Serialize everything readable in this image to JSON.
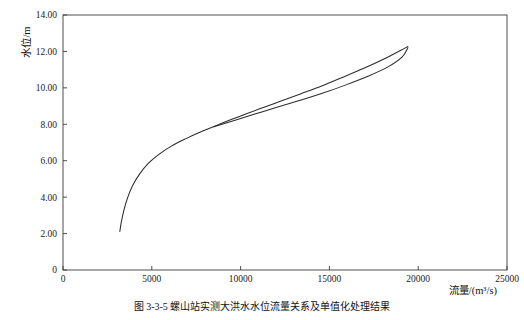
{
  "figure": {
    "caption": "图 3-3-5  螺山站实测大洪水水位流量关系及单值化处理结果"
  },
  "chart_data": {
    "type": "line",
    "title": "",
    "xlabel": "流量/(m³/s)",
    "ylabel": "水位/m",
    "xlim": [
      0,
      25000
    ],
    "ylim": [
      0,
      14
    ],
    "grid": false,
    "legend": "none",
    "x_ticks": [
      0,
      5000,
      10000,
      15000,
      20000,
      25000
    ],
    "x_tick_labels": [
      "0",
      "5000",
      "10000",
      "15000",
      "20000",
      "25000"
    ],
    "y_ticks": [
      0,
      2,
      4,
      6,
      8,
      10,
      12,
      14
    ],
    "y_tick_labels": [
      "0",
      "2.00",
      "4.00",
      "6.00",
      "8.00",
      "10.00",
      "12.00",
      "14.00"
    ],
    "series": [
      {
        "name": "实测水位流量关系（涨洪段）",
        "x": [
          3200,
          3280,
          3420,
          3620,
          3900,
          4300,
          4800,
          5400,
          6100,
          6900,
          7800,
          8800,
          9900,
          11000,
          12200,
          13400,
          14600,
          15800,
          17000,
          18100,
          19000,
          19420
        ],
        "y": [
          2.12,
          2.62,
          3.25,
          3.92,
          4.6,
          5.25,
          5.85,
          6.35,
          6.8,
          7.2,
          7.6,
          8.0,
          8.42,
          8.82,
          9.25,
          9.68,
          10.12,
          10.6,
          11.1,
          11.6,
          12.05,
          12.27
        ]
      },
      {
        "name": "单值化处理后关系（退水段）",
        "x": [
          8500,
          9600,
          10800,
          12000,
          13300,
          14600,
          15900,
          17200,
          18300,
          19100,
          19420
        ],
        "y": [
          7.86,
          8.2,
          8.56,
          8.92,
          9.3,
          9.7,
          10.15,
          10.65,
          11.15,
          11.7,
          12.2
        ]
      }
    ]
  }
}
